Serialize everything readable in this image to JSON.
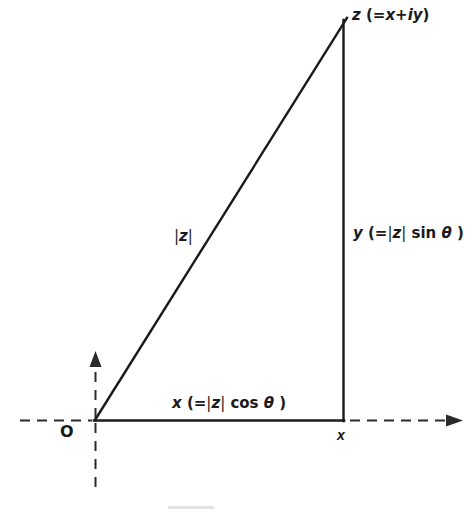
{
  "figure": {
    "type": "geometric-diagram",
    "background_color": "#ffffff",
    "line_color": "#1a1a1a",
    "labels": {
      "apex": {
        "name": "z",
        "text": "z (=x+iy)",
        "parts": {
          "symbol": "z",
          "open": " (=",
          "re": "x",
          "plus": "+",
          "im": "iy",
          "close": ")"
        }
      },
      "vertical_leg": {
        "name": "y",
        "text": "y (=|z| sin θ)",
        "parts": {
          "symbol": "y",
          "open": " (=",
          "bar_l": "|",
          "mod": "z",
          "bar_r": "|",
          "func": " sin ",
          "angle": "θ",
          "close": " )"
        }
      },
      "horizontal_leg": {
        "name": "x",
        "text": "x (=|z| cos θ)",
        "parts": {
          "symbol": "x",
          "open": " (=",
          "bar_l": "|",
          "mod": "z",
          "bar_r": "|",
          "func": " cos ",
          "angle": "θ",
          "close": " )"
        }
      },
      "hypotenuse": {
        "name": "modulus",
        "text": "|z|",
        "parts": {
          "bar_l": "|",
          "mod": "z",
          "bar_r": "|"
        }
      },
      "origin": {
        "name": "O",
        "text": "O"
      },
      "x_axis_point": {
        "name": "x",
        "text": "x"
      }
    },
    "geometry": {
      "origin_point": {
        "x": 95,
        "y": 420
      },
      "apex_point": {
        "x": 347,
        "y": 18
      },
      "right_angle_point": {
        "x": 343,
        "y": 420
      },
      "horizontal_axis": {
        "y": 420,
        "dashed_left_start": 20,
        "dashed_right_end": 462,
        "arrow": "right"
      },
      "vertical_axis": {
        "x": 95,
        "dashed_top": 355,
        "dashed_bottom": 492,
        "arrow": "up"
      }
    }
  }
}
